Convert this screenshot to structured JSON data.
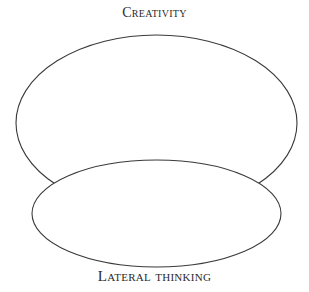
{
  "diagram": {
    "type": "overlapping-ellipses",
    "top_label": "Creativity",
    "bottom_label": "Lateral thinking",
    "stroke_color": "#3a3a3a",
    "fill_color": "#ffffff",
    "ellipses": [
      {
        "name": "creativity",
        "cx": 156.5,
        "cy": 123,
        "rx": 140.5,
        "ry": 88
      },
      {
        "name": "lateral-thinking",
        "cx": 156.5,
        "cy": 213.5,
        "rx": 124.5,
        "ry": 53.5
      }
    ]
  }
}
